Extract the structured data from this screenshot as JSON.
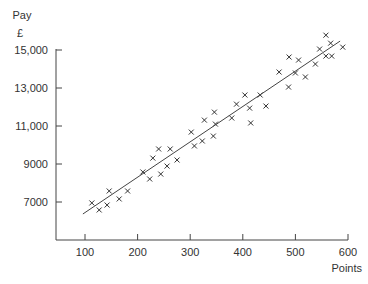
{
  "chart_data": {
    "type": "scatter",
    "title": "",
    "ylabel": "Pay",
    "yunit": "£",
    "xlabel": "Points",
    "xlim": [
      43,
      600
    ],
    "ylim": [
      5000,
      15000
    ],
    "xticks": [
      100,
      200,
      300,
      400,
      500,
      600
    ],
    "xtick_labels": [
      "100",
      "200",
      "300",
      "400",
      "500",
      "600"
    ],
    "yticks": [
      7000,
      9000,
      11000,
      13000,
      15000
    ],
    "ytick_labels": [
      "7000",
      "9000",
      "11,000",
      "13,000",
      "15,000"
    ],
    "grid": false,
    "marker": "x",
    "series": [
      {
        "name": "observations",
        "points": [
          [
            113,
            6950
          ],
          [
            127,
            6580
          ],
          [
            142,
            6840
          ],
          [
            165,
            7160
          ],
          [
            146,
            7580
          ],
          [
            181,
            7580
          ],
          [
            210,
            8580
          ],
          [
            223,
            8210
          ],
          [
            244,
            8470
          ],
          [
            229,
            9310
          ],
          [
            256,
            8890
          ],
          [
            275,
            9210
          ],
          [
            240,
            9790
          ],
          [
            262,
            9790
          ],
          [
            308,
            9950
          ],
          [
            323,
            10210
          ],
          [
            302,
            10680
          ],
          [
            344,
            10470
          ],
          [
            348,
            11100
          ],
          [
            327,
            11310
          ],
          [
            346,
            11730
          ],
          [
            379,
            11420
          ],
          [
            415,
            11160
          ],
          [
            388,
            12150
          ],
          [
            413,
            11940
          ],
          [
            404,
            12630
          ],
          [
            433,
            12630
          ],
          [
            444,
            12050
          ],
          [
            487,
            13050
          ],
          [
            469,
            13840
          ],
          [
            500,
            13790
          ],
          [
            519,
            13580
          ],
          [
            488,
            14630
          ],
          [
            506,
            14470
          ],
          [
            538,
            14260
          ],
          [
            546,
            15050
          ],
          [
            558,
            14680
          ],
          [
            569,
            14680
          ],
          [
            567,
            15360
          ],
          [
            558,
            15780
          ],
          [
            590,
            15150
          ]
        ]
      }
    ],
    "trend_line": {
      "name": "line of best fit",
      "from": [
        96,
        6370
      ],
      "to": [
        585,
        15470
      ]
    }
  }
}
